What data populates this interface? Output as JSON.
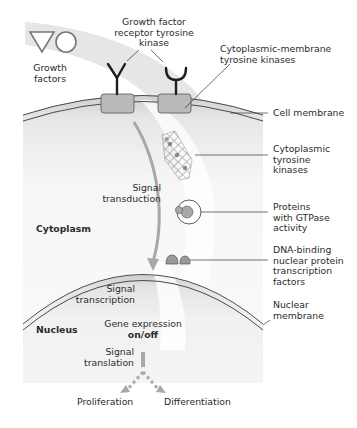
{
  "diagram": {
    "labels": {
      "growth_factors": [
        "Growth",
        "factors"
      ],
      "receptor_kinase": [
        "Growth factor",
        "receptor tyrosine",
        "kinase"
      ],
      "membrane_kinases": [
        "Cytoplasmic-membrane",
        "tyrosine kinases"
      ],
      "cell_membrane": "Cell membrane",
      "cytoplasmic_kinases": [
        "Cytoplasmic",
        "tyrosine",
        "kinases"
      ],
      "signal_transduction": [
        "Signal",
        "transduction"
      ],
      "gtpase_proteins": [
        "Proteins",
        "with GTPase",
        "activity"
      ],
      "cytoplasm": "Cytoplasm",
      "dna_binding": [
        "DNA-binding",
        "nuclear protein",
        "transcription",
        "factors"
      ],
      "signal_transcription": [
        "Signal",
        "transcription"
      ],
      "nuclear_membrane": [
        "Nuclear",
        "membrane"
      ],
      "nucleus": "Nucleus",
      "gene_expression": [
        "Gene expression",
        "on/off"
      ],
      "signal_translation": [
        "Signal",
        "translation"
      ],
      "proliferation": "Proliferation",
      "differentiation": "Differentiation"
    },
    "colors": {
      "background": "#ffffff",
      "cell_fill_light": "#f4f4f4",
      "cell_fill_dark": "#d6d6d6",
      "swoosh": "#e4e4e4",
      "arrow_gray": "#a9a9a9",
      "membrane_line": "#555555",
      "kinase_box": "#b8b8b8",
      "receptor": "#1e1e1e"
    }
  }
}
